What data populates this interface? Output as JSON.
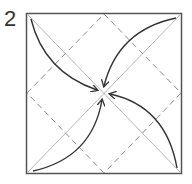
{
  "diagram": {
    "step_number": "2",
    "type": "origami-fold-diagram",
    "colors": {
      "outline": "#555555",
      "diagonal": "#b0b0b0",
      "dashed": "#8a8a8a",
      "arrow": "#333333"
    }
  }
}
